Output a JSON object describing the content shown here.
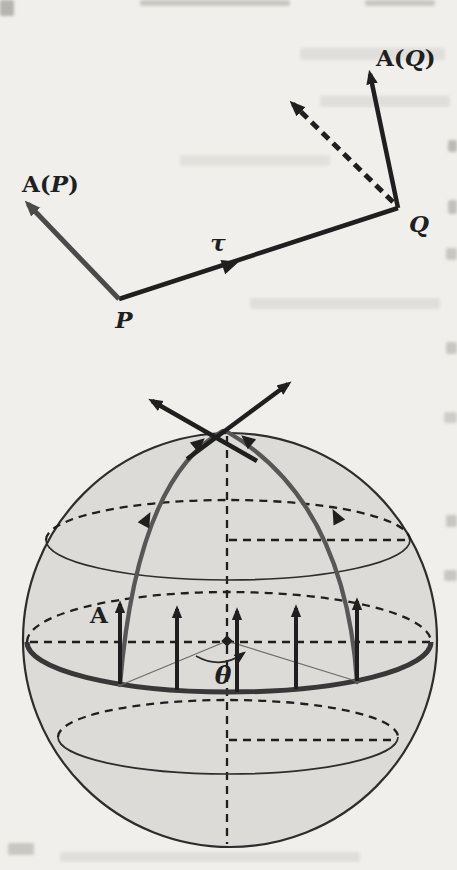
{
  "figure": {
    "top_diagram": {
      "label_vector_p": {
        "vector": "A",
        "open": "(",
        "point": "P",
        "close": ")"
      },
      "label_vector_q": {
        "vector": "A",
        "open": "(",
        "point": "Q",
        "close": ")"
      },
      "label_tau": "τ",
      "label_point_p": "P",
      "label_point_q": "Q"
    },
    "sphere_diagram": {
      "label_vector_field": "A",
      "label_angle": "θ"
    }
  },
  "colors": {
    "ink": "#1f1f1f",
    "vector_gray": "#4a4a4a",
    "meridian_gray": "#575757",
    "transport_path": "#383838",
    "sphere_fill": "#dcdbd7",
    "sphere_outline": "#2d2d2d",
    "page_bg": "#f0efeb"
  }
}
